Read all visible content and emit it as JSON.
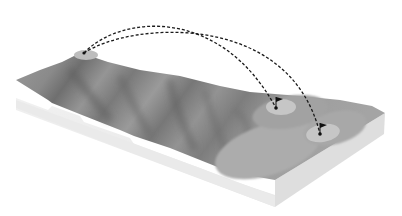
{
  "diagram": {
    "colors": {
      "background": "#ffffff",
      "terrain_base": "#8e8e8e",
      "terrain_ridge_dark": "#6e6e6e",
      "terrain_light": "#a6a6a6",
      "green": "#c4c4c4",
      "fairway": "#b4b4b4",
      "side_face": "#ececec",
      "side_face_right": "#dcdcdc",
      "trajectory": "#1a1a1a"
    },
    "tee": {
      "label": "tee",
      "x": 84,
      "y": 53
    },
    "targets": [
      {
        "label": "flag-1",
        "x": 276,
        "y": 108,
        "green_cx": 281,
        "green_cy": 107,
        "green_rx": 15,
        "green_ry": 8
      },
      {
        "label": "flag-2",
        "x": 320,
        "y": 134,
        "green_cx": 323,
        "green_cy": 133,
        "green_rx": 17,
        "green_ry": 9
      }
    ],
    "trajectories": [
      {
        "from": "tee",
        "to": "flag-1",
        "peak_y": 19
      },
      {
        "from": "tee",
        "to": "flag-2",
        "peak_y": 25
      }
    ]
  }
}
